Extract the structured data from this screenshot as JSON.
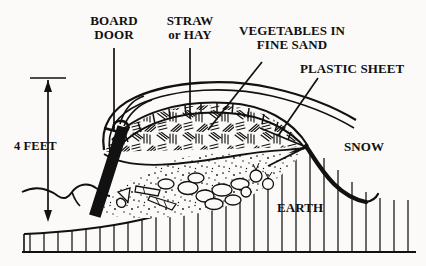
{
  "diagram": {
    "background_color": "#fbfaf8",
    "ink_color": "#111111",
    "labels": {
      "board_door": "BOARD\nDOOR",
      "straw_or_hay": "STRAW\nor HAY",
      "vegetables_in_fine_sand": "VEGETABLES IN\nFINE SAND",
      "plastic_sheet": "PLASTIC SHEET",
      "snow": "SNOW",
      "earth": "EARTH",
      "dimension_height": "4 FEET"
    },
    "layers": [
      {
        "name": "plastic-sheet",
        "description": "outer arched cover over mound"
      },
      {
        "name": "straw-or-hay",
        "description": "hatched insulating layer beneath cover"
      },
      {
        "name": "vegetables-in-fine-sand",
        "description": "stippled sand bed holding carrots, potatoes and beets"
      },
      {
        "name": "earth",
        "description": "hatched ground mass below grade"
      },
      {
        "name": "snow",
        "description": "thick drifted line over right slope"
      }
    ],
    "dimension": {
      "label": "4 FEET",
      "orientation": "vertical",
      "arrow_style": "double-headed with end ticks"
    }
  }
}
